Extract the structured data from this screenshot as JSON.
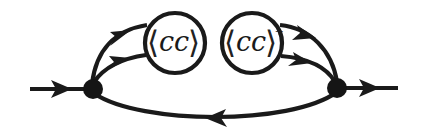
{
  "diagram": {
    "type": "feynman-diagram",
    "colors": {
      "line": "#1a1a1a",
      "vertex": "#151515",
      "background": "#ffffff"
    },
    "external_lines": {
      "incoming": {
        "direction": "right"
      },
      "outgoing": {
        "direction": "right"
      }
    },
    "vertices": [
      {
        "id": "left-vertex"
      },
      {
        "id": "right-vertex"
      }
    ],
    "insertions": [
      {
        "id": "condensate",
        "label_open": "⟨",
        "label_body": "cc",
        "label_close": "⟩",
        "superscript": ""
      },
      {
        "id": "condensate-conjugate",
        "label_open": "⟨",
        "label_body": "cc",
        "label_close": "⟩",
        "superscript": "+"
      }
    ],
    "internal_lines": {
      "left_to_condensate": {
        "count": 2,
        "direction": "into-bubble"
      },
      "conjugate_to_right": {
        "count": 2,
        "direction": "into-vertex"
      },
      "return_arc": {
        "direction": "left"
      }
    }
  }
}
